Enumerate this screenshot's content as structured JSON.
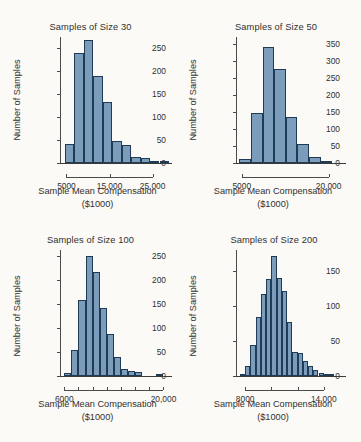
{
  "figure": {
    "background": "#fbfaf7",
    "bar_fill": "#7b9cba",
    "bar_stroke": "#1f3b55",
    "axis_color": "#4a4a48"
  },
  "chart_data": [
    {
      "type": "bar",
      "id": "samples-of-size-30",
      "title": "Samples of Size 30",
      "xlabel": "Sample Mean Compensation",
      "xlabel2": "($1000)",
      "ylabel": "Number of Samples",
      "ylim": [
        0,
        275
      ],
      "yticks": [
        0,
        50,
        100,
        150,
        200,
        250
      ],
      "ytick_labels": [
        "0",
        "50",
        "100",
        "150",
        "200",
        "250"
      ],
      "xlim": [
        3500,
        29500
      ],
      "xticks": [
        5000,
        15000,
        25000
      ],
      "xtick_labels": [
        "5000",
        "15,000",
        "25,000"
      ],
      "grid": false,
      "bin_width": 2200,
      "bin_starts": [
        4600,
        6800,
        9000,
        11200,
        13400,
        15600,
        17800,
        20000,
        22200,
        24400,
        26600
      ],
      "values": [
        41,
        241,
        268,
        189,
        134,
        48,
        40,
        14,
        11,
        3,
        1
      ],
      "categories": [
        "4600-6800",
        "6800-9000",
        "9000-11200",
        "11200-13400",
        "13400-15600",
        "15600-17800",
        "17800-20000",
        "20000-22200",
        "22200-24400",
        "24400-26600",
        "26600-28800"
      ]
    },
    {
      "type": "bar",
      "id": "samples-of-size-50",
      "title": "Samples of Size 50",
      "xlabel": "Sample Mean Compensation",
      "xlabel2": "($1000)",
      "ylabel": "Number of Samples",
      "ylim": [
        0,
        370
      ],
      "yticks": [
        0,
        50,
        100,
        150,
        200,
        250,
        300,
        350
      ],
      "ytick_labels": [
        "0",
        "50",
        "100",
        "150",
        "200",
        "250",
        "300",
        "350"
      ],
      "xlim": [
        4000,
        23000
      ],
      "xticks": [
        5000,
        20000
      ],
      "xtick_labels": [
        "5000",
        "20,000"
      ],
      "grid": false,
      "bin_width": 2000,
      "bin_starts": [
        4600,
        6600,
        8600,
        10600,
        12600,
        14600,
        16600,
        18600
      ],
      "values": [
        12,
        146,
        340,
        277,
        135,
        57,
        19,
        6
      ],
      "categories": [
        "4600-6600",
        "6600-8600",
        "8600-10600",
        "10600-12600",
        "12600-14600",
        "14600-16600",
        "16600-18600",
        "18600-20600"
      ]
    },
    {
      "type": "bar",
      "id": "samples-of-size-100",
      "title": "Samples of Size 100",
      "xlabel": "Sample Mean Compensation",
      "xlabel2": "($1000)",
      "ylabel": "Number of Samples",
      "ylim": [
        0,
        262
      ],
      "yticks": [
        0,
        50,
        100,
        150,
        200,
        250
      ],
      "ytick_labels": [
        "0",
        "50",
        "100",
        "150",
        "200",
        "250"
      ],
      "xlim": [
        5400,
        21200
      ],
      "xticks": [
        6000,
        8000,
        10000,
        12000,
        14000,
        16000,
        18000,
        20000
      ],
      "xtick_labels": [
        "6000",
        "",
        "",
        "",
        "",
        "",
        "",
        "20,000"
      ],
      "grid": false,
      "bin_width": 1000,
      "bin_starts": [
        6000,
        7000,
        8000,
        9000,
        10000,
        11000,
        12000,
        13000,
        14000,
        15000,
        16000,
        19000
      ],
      "values": [
        7,
        54,
        159,
        250,
        216,
        142,
        88,
        40,
        15,
        10,
        8,
        2
      ],
      "categories": [
        "6000-7000",
        "7000-8000",
        "8000-9000",
        "9000-10000",
        "10000-11000",
        "11000-12000",
        "12000-13000",
        "13000-14000",
        "14000-15000",
        "15000-16000",
        "16000-17000",
        "19000-20000"
      ]
    },
    {
      "type": "bar",
      "id": "samples-of-size-200",
      "title": "Samples of Size 200",
      "xlabel": "Sample Mean Compensation",
      "xlabel2": "($1000)",
      "ylabel": "Number of Samples",
      "ylim": [
        0,
        180
      ],
      "yticks": [
        0,
        50,
        100,
        150
      ],
      "ytick_labels": [
        "0",
        "50",
        "100",
        "150"
      ],
      "xlim": [
        7300,
        15700
      ],
      "xticks": [
        8000,
        10000,
        12000,
        14000
      ],
      "xtick_labels": [
        "8000",
        "",
        "",
        "14,000"
      ],
      "grid": false,
      "bin_width": 400,
      "bin_starts": [
        7600,
        8000,
        8400,
        8800,
        9200,
        9600,
        10000,
        10400,
        10800,
        11200,
        11600,
        12000,
        12400,
        12800,
        13200,
        13600,
        14000,
        14400
      ],
      "values": [
        3,
        14,
        44,
        84,
        117,
        139,
        172,
        140,
        122,
        77,
        34,
        33,
        22,
        15,
        9,
        5,
        3,
        2
      ],
      "categories": [
        "7600-8000",
        "8000-8400",
        "8400-8800",
        "8800-9200",
        "9200-9600",
        "9600-10000",
        "10000-10400",
        "10400-10800",
        "10800-11200",
        "11200-11600",
        "11600-12000",
        "12000-12400",
        "12400-12800",
        "12800-13200",
        "13200-13600",
        "13600-14000",
        "14000-14400",
        "14400-14800"
      ]
    }
  ]
}
